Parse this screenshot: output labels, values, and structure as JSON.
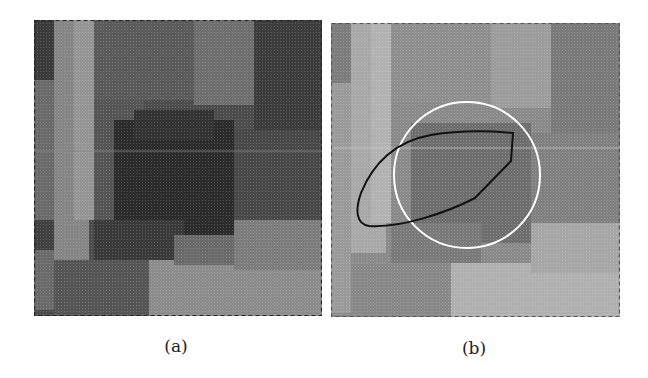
{
  "figure": {
    "panels": [
      {
        "id": "a",
        "caption": "(a)",
        "content": "grayscale blocky pixelated image patch with dark blob in center",
        "colors": {
          "dark": "#2e2e2e",
          "mid": "#6a6a6a",
          "light": "#9c9c9c"
        }
      },
      {
        "id": "b",
        "caption": "(b)",
        "content": "same patch, lighter contrast, with white circle and black closed contour overlay",
        "overlays": {
          "circle": {
            "color": "#ffffff",
            "cx": 136,
            "cy": 152,
            "r": 73
          },
          "contour": {
            "color": "#111111"
          }
        },
        "colors": {
          "dark": "#6c6c6c",
          "mid": "#8a8a8a",
          "light": "#b0b0b0"
        }
      }
    ]
  }
}
